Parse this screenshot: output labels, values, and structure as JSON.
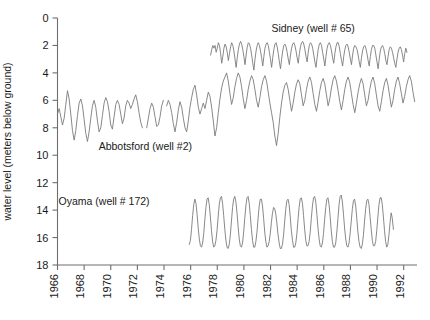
{
  "chart_data": {
    "type": "line",
    "title": "",
    "xlabel": "",
    "ylabel": "water level (meters below ground)",
    "xlim": [
      1966,
      1993
    ],
    "ylim": [
      18,
      0
    ],
    "y_inverted": true,
    "grid": false,
    "legend_position": "inline-annotations",
    "xticks": [
      1966,
      1968,
      1970,
      1972,
      1974,
      1976,
      1978,
      1980,
      1982,
      1984,
      1986,
      1988,
      1990,
      1992
    ],
    "xtick_labels": [
      "1966",
      "1968",
      "1970",
      "1972",
      "1974",
      "1976",
      "1978",
      "1980",
      "1982",
      "1984",
      "1986",
      "1988",
      "1990",
      "1992"
    ],
    "xtick_rotation": 90,
    "yticks": [
      0,
      2,
      4,
      6,
      8,
      10,
      12,
      14,
      16,
      18
    ],
    "ytick_labels": [
      "0",
      "2",
      "4",
      "6",
      "8",
      "10",
      "12",
      "14",
      "16",
      "18"
    ],
    "line_color": "#7b7b7b",
    "axis_color": "#6e6e6e",
    "annotations": [
      {
        "name": "sidney-label",
        "text": "Sidney (well # 65)",
        "x": 1985.2,
        "y": 1.0
      },
      {
        "name": "abbotsford-label",
        "text": "Abbotsford (well #2)",
        "x": 1972.6,
        "y": 9.6
      },
      {
        "name": "oyama-label",
        "text": "Oyama (well # 172)",
        "x": 1969.5,
        "y": 13.6
      }
    ],
    "series": [
      {
        "name": "Abbotsford (well #2)",
        "well": "well #2",
        "color": "#7b7b7b",
        "segments": [
          {
            "x_start": 1966.0,
            "x_step": 0.125,
            "values": [
              7.0,
              6.6,
              7.2,
              7.8,
              7.3,
              6.3,
              5.3,
              5.9,
              7.0,
              8.2,
              8.9,
              8.2,
              7.1,
              6.2,
              5.9,
              6.4,
              7.4,
              8.4,
              9.0,
              8.3,
              7.3,
              6.4,
              6.0,
              6.5,
              7.5,
              8.3,
              8.0,
              7.1,
              6.2,
              5.8,
              6.1,
              6.8,
              7.8,
              8.1,
              7.2,
              6.3,
              6.0,
              6.3,
              7.0,
              7.7,
              7.3,
              6.4,
              6.0,
              6.2,
              6.6,
              6.3,
              5.9,
              5.6,
              6.1,
              6.9,
              7.6,
              8.0
            ]
          },
          {
            "x_start": 1972.7,
            "x_step": 0.125,
            "values": [
              8.0,
              7.3,
              6.6,
              6.2,
              6.5,
              7.2,
              7.9,
              7.8,
              7.2,
              6.4,
              6.0
            ]
          },
          {
            "x_start": 1974.2,
            "x_step": 0.125,
            "values": [
              6.4,
              6.0,
              6.3,
              6.9,
              7.7,
              8.3,
              7.6,
              6.7,
              6.1,
              6.5,
              7.3,
              8.0,
              8.3,
              7.5,
              6.5,
              5.8,
              5.2,
              4.9,
              5.6,
              6.5,
              7.0,
              6.6,
              6.2,
              6.6,
              6.0,
              5.4,
              5.7,
              6.5,
              7.5,
              8.6,
              8.0,
              6.9,
              5.9,
              5.1,
              4.6,
              4.3,
              4.0,
              4.6,
              5.5,
              6.3,
              5.8,
              5.0,
              4.4,
              4.0,
              4.3,
              5.0,
              5.9,
              6.6,
              6.0,
              5.2,
              4.6,
              4.2,
              4.5,
              5.2,
              6.0,
              6.5,
              5.8,
              5.0,
              4.5,
              4.2,
              4.6,
              5.4,
              6.2,
              6.9,
              7.6,
              8.6,
              9.3,
              8.4,
              7.2,
              6.2,
              5.4,
              4.9,
              4.7,
              5.2,
              6.0,
              6.8,
              6.2,
              5.4,
              4.8,
              4.5,
              4.8,
              5.6,
              6.4,
              6.0,
              5.2,
              4.6,
              4.3,
              4.7,
              5.5,
              6.3,
              6.8,
              6.1,
              5.3,
              4.7,
              4.4,
              4.8,
              5.6,
              6.4,
              5.9,
              5.1,
              4.5,
              4.2,
              4.6,
              5.3,
              6.1,
              6.7,
              6.0,
              5.2,
              4.6,
              4.3,
              4.7,
              5.5,
              6.3,
              6.9,
              6.2,
              5.4,
              4.8,
              4.4,
              4.8,
              5.6,
              6.4,
              6.0,
              5.2,
              4.6,
              4.3,
              4.8,
              5.6,
              6.4,
              6.8,
              6.1,
              5.3,
              4.7,
              4.4,
              4.9,
              5.7,
              6.5,
              6.0,
              5.2,
              4.6,
              4.3,
              4.8,
              5.5,
              6.2,
              5.7,
              5.0,
              4.5,
              4.2,
              4.6,
              5.4,
              6.1
            ]
          }
        ]
      },
      {
        "name": "Sidney (well # 65)",
        "well": "well # 65",
        "color": "#7b7b7b",
        "segments": [
          {
            "x_start": 1977.5,
            "x_step": 0.0833,
            "values": [
              2.7,
              2.3,
              2.0,
              2.2,
              2.0,
              2.5,
              2.2,
              1.8,
              2.0,
              2.6,
              3.3,
              2.8,
              2.2,
              1.9,
              2.1,
              2.5,
              3.1,
              2.6,
              2.1,
              1.8,
              2.0,
              2.4,
              3.0,
              3.6,
              2.9,
              2.3,
              1.9,
              1.7,
              1.9,
              2.3,
              2.8,
              3.4,
              2.7,
              2.1,
              1.8,
              1.9,
              2.2,
              2.7,
              3.3,
              3.8,
              3.0,
              2.4,
              2.0,
              1.8,
              2.0,
              2.4,
              2.9,
              3.5,
              2.8,
              2.2,
              1.9,
              1.8,
              2.0,
              2.5,
              3.0,
              3.6,
              2.9,
              2.3,
              1.9,
              1.8,
              2.1,
              2.6,
              3.2,
              3.7,
              3.0,
              2.4,
              2.0,
              1.9,
              2.1,
              2.5,
              3.0,
              3.4,
              2.7,
              2.2,
              1.9,
              1.8,
              2.0,
              2.4,
              2.9,
              3.3,
              2.6,
              2.1,
              1.8,
              1.7,
              1.9,
              2.3,
              2.8,
              3.2,
              2.5,
              2.0,
              1.8,
              1.9,
              2.2,
              2.7,
              3.2,
              3.6,
              2.9,
              2.3,
              1.9,
              1.8,
              2.0,
              2.5,
              3.0,
              3.5,
              2.8,
              2.2,
              1.9,
              1.8,
              2.0,
              2.4,
              2.9,
              3.3,
              2.6,
              2.1,
              1.8,
              1.8,
              2.1,
              2.6,
              3.1,
              3.5,
              2.8,
              2.3,
              2.0,
              1.9,
              2.1,
              2.5,
              3.0,
              3.4,
              2.7,
              2.2,
              2.0,
              2.1,
              2.3,
              2.7,
              3.2,
              3.6,
              2.9,
              2.4,
              2.1,
              2.0,
              2.2,
              2.6,
              3.1,
              3.5,
              2.8,
              2.3,
              2.0,
              2.0,
              2.2,
              2.7,
              3.2,
              3.7,
              3.0,
              2.4,
              2.1,
              2.0,
              2.2,
              2.6,
              3.1,
              3.4,
              2.8,
              2.3,
              2.1,
              2.2,
              2.5,
              2.9,
              3.3,
              3.6,
              3.0,
              2.5,
              2.2,
              2.1,
              2.3,
              2.7,
              3.2,
              2.6,
              2.2,
              2.5
            ]
          }
        ]
      },
      {
        "name": "Oyama (well # 172)",
        "well": "well # 172",
        "color": "#7b7b7b",
        "segments": [
          {
            "x_start": 1975.9,
            "x_step": 0.0833,
            "values": [
              16.5,
              16.2,
              15.4,
              14.4,
              13.6,
              13.2,
              13.5,
              14.3,
              15.3,
              16.1,
              16.6,
              16.7,
              16.4,
              15.7,
              14.7,
              13.8,
              13.2,
              13.1,
              13.6,
              14.5,
              15.5,
              16.3,
              16.7,
              16.6,
              16.2,
              15.5,
              14.5,
              13.6,
              13.1,
              13.0,
              13.5,
              14.4,
              15.4,
              16.2,
              16.7,
              16.8,
              16.5,
              15.8,
              14.8,
              13.8,
              13.2,
              13.0,
              13.4,
              14.2,
              15.2,
              16.1,
              16.6,
              16.7,
              16.4,
              15.6,
              14.6,
              13.7,
              13.1,
              13.0,
              13.5,
              14.4,
              15.4,
              16.2,
              16.7,
              16.7,
              16.3,
              15.6,
              14.6,
              13.7,
              13.2,
              13.2,
              13.7,
              14.6,
              15.6,
              16.3,
              16.7,
              16.6,
              16.3,
              15.7,
              14.9,
              14.2,
              13.8,
              13.9,
              14.3,
              15.0,
              15.8,
              16.4,
              16.8,
              16.8,
              16.5,
              15.8,
              14.8,
              13.9,
              13.3,
              13.2,
              13.6,
              14.5,
              15.5,
              16.2,
              16.7,
              16.7,
              16.4,
              15.7,
              14.7,
              13.8,
              13.2,
              13.1,
              13.5,
              14.4,
              15.4,
              16.2,
              16.6,
              16.6,
              16.3,
              15.6,
              14.6,
              13.7,
              13.1,
              13.0,
              13.4,
              14.3,
              15.3,
              16.1,
              16.6,
              16.7,
              16.4,
              15.7,
              14.7,
              13.8,
              13.2,
              13.1,
              13.6,
              14.5,
              15.5,
              16.3,
              16.7,
              16.7,
              16.4,
              15.6,
              14.6,
              13.6,
              13.0,
              12.9,
              13.4,
              14.3,
              15.3,
              16.1,
              16.6,
              16.7,
              16.4,
              15.7,
              14.8,
              13.9,
              13.3,
              13.2,
              13.7,
              14.6,
              15.6,
              16.3,
              16.7,
              16.8,
              16.5,
              15.8,
              14.8,
              13.9,
              13.3,
              13.2,
              13.6,
              14.5,
              15.4,
              16.2,
              16.6,
              16.6,
              16.3,
              15.5,
              14.5,
              13.6,
              13.1,
              13.1,
              13.6,
              14.5,
              15.5,
              16.3,
              16.7,
              16.5,
              15.8,
              14.9,
              14.2,
              14.6,
              15.4
            ]
          }
        ]
      }
    ]
  }
}
